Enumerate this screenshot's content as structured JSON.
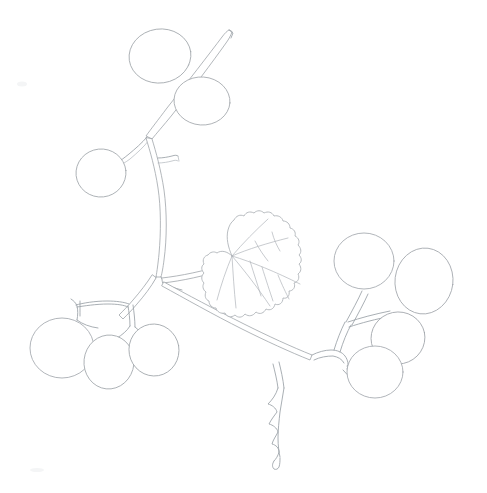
{
  "artwork": {
    "title": "Berry Branch Pencil Sketch",
    "subject": "grape-berry-branch-with-leaf",
    "medium": "graphite pencil line drawing",
    "caption": "",
    "background_color": "#ffffff",
    "line_color": "#9aa0a6",
    "faint_line_color": "#b6bbc0",
    "canvas": {
      "width": 487,
      "height": 493
    }
  },
  "elements": {
    "main_stem_label": "main-stem",
    "upper_branch_label": "upper-branch",
    "leaf_label": "serrated-leaf",
    "tendril_label": "hanging-tendril",
    "left_cluster_label": "lower-left-berry-cluster",
    "right_cluster_label": "right-berry-cluster",
    "top_berries_label": "upper-berries"
  },
  "berries": [
    {
      "name": "berry-top-left",
      "cx": 160,
      "cy": 56,
      "rx": 31,
      "ry": 27,
      "rot": -8
    },
    {
      "name": "berry-top-right",
      "cx": 202,
      "cy": 101,
      "rx": 28,
      "ry": 24,
      "rot": 4
    },
    {
      "name": "berry-upper-left",
      "cx": 101,
      "cy": 173,
      "rx": 25,
      "ry": 24,
      "rot": -6
    },
    {
      "name": "berry-left-a",
      "cx": 62,
      "cy": 348,
      "rx": 32,
      "ry": 30,
      "rot": 0
    },
    {
      "name": "berry-left-b",
      "cx": 109,
      "cy": 362,
      "rx": 25,
      "ry": 27,
      "rot": 6
    },
    {
      "name": "berry-left-c",
      "cx": 154,
      "cy": 350,
      "rx": 25,
      "ry": 26,
      "rot": -10
    },
    {
      "name": "berry-right-a",
      "cx": 364,
      "cy": 261,
      "rx": 30,
      "ry": 28,
      "rot": 0
    },
    {
      "name": "berry-right-b",
      "cx": 424,
      "cy": 281,
      "rx": 29,
      "ry": 33,
      "rot": 7
    },
    {
      "name": "berry-right-c",
      "cx": 398,
      "cy": 338,
      "rx": 27,
      "ry": 26,
      "rot": -12
    },
    {
      "name": "berry-right-d",
      "cx": 375,
      "cy": 372,
      "rx": 28,
      "ry": 26,
      "rot": 0
    }
  ],
  "leaf": {
    "name": "serrated-leaf",
    "lobes": 5,
    "vein_count": 6,
    "petiole_attachment": {
      "x": 232,
      "y": 256
    }
  },
  "counts": {
    "berries_total": 10,
    "leaves_total": 1,
    "clusters_total": 2,
    "tendrils_total": 1
  }
}
